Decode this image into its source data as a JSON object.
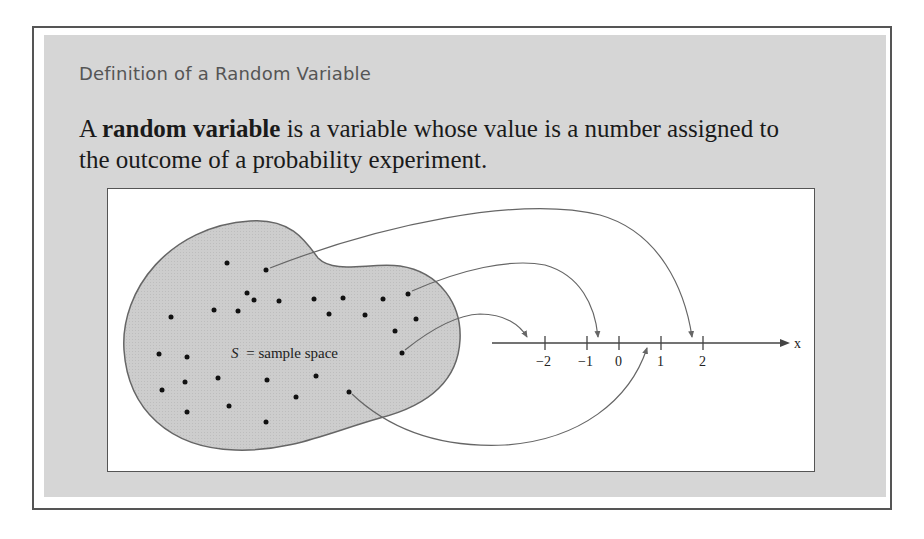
{
  "heading": "Definition of a Random Variable",
  "definition": {
    "prefix": "A ",
    "term": "random variable",
    "line1_rest": " is a variable whose value is a number assigned to",
    "line2": "the outcome of a probability experiment."
  },
  "figure": {
    "sample_space_label_s": "S",
    "sample_space_label_rest": "= sample space",
    "axis_label": "x",
    "ticks": [
      "−2",
      "−1",
      "0",
      "1",
      "2"
    ],
    "colors": {
      "panel": "#d6d6d6",
      "blob": "#cfcfcf",
      "lines": "#666666",
      "dots": "#111111"
    }
  }
}
